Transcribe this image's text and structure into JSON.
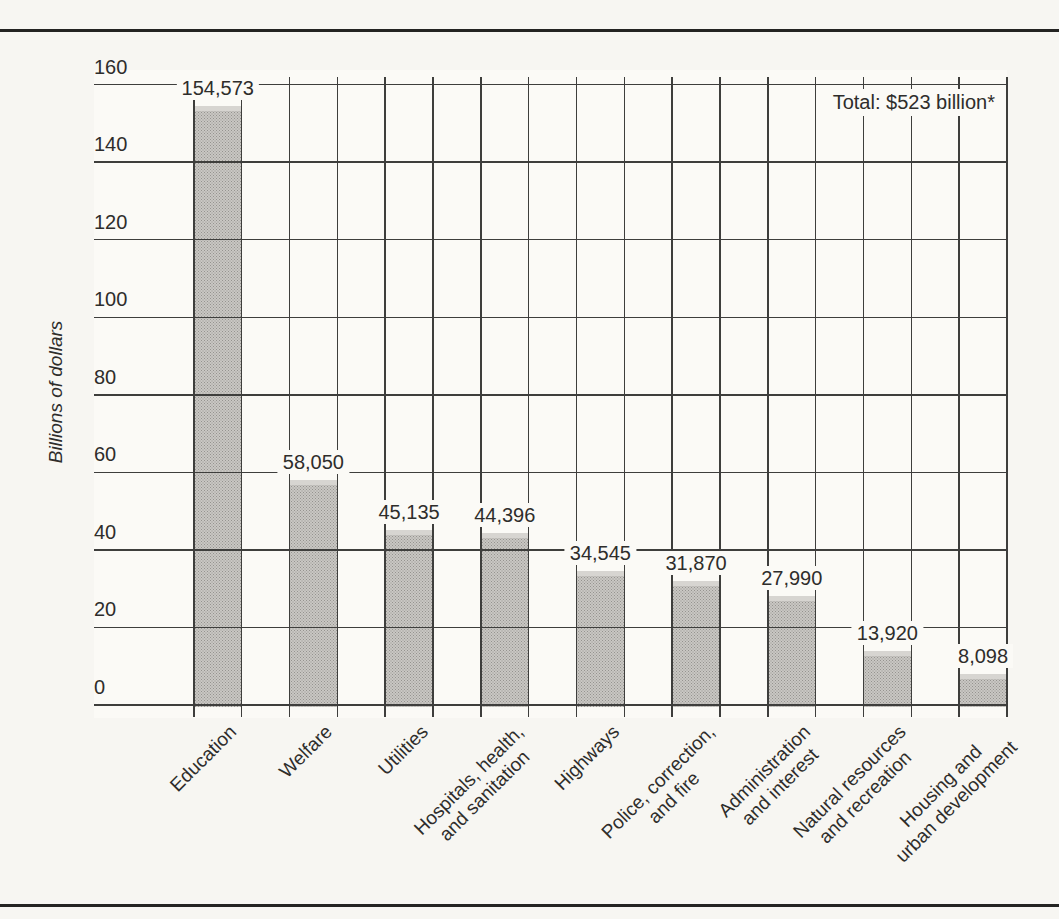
{
  "page": {
    "background": "#f7f6f2",
    "rule_color": "#242422"
  },
  "chart_data": {
    "type": "bar",
    "ylabel": "Billions of dollars",
    "annotation": "Total: $523 billion*",
    "categories": [
      "Education",
      "Welfare",
      "Utilities",
      "Hospitals, health,\nand sanitation",
      "Highways",
      "Police, correction,\nand fire",
      "Administration\nand interest",
      "Natural resources\nand recreation",
      "Housing and\nurban development"
    ],
    "values": [
      154573,
      58050,
      45135,
      44396,
      34545,
      31870,
      27990,
      13920,
      8098
    ],
    "value_labels": [
      "154,573",
      "58,050",
      "45,135",
      "44,396",
      "34,545",
      "31,870",
      "27,990",
      "13,920",
      "8,098"
    ],
    "y_ticks": [
      0,
      20,
      40,
      60,
      80,
      100,
      120,
      140,
      160
    ],
    "ylim": [
      0,
      160
    ],
    "grid": true,
    "legend": false,
    "bar_color": "#c9c7c3",
    "bar_dot_color": "#95938f",
    "bar_top_color": "#d7d5d1",
    "line_color": "#3e3e3c",
    "text_color": "#2e2d2b"
  }
}
